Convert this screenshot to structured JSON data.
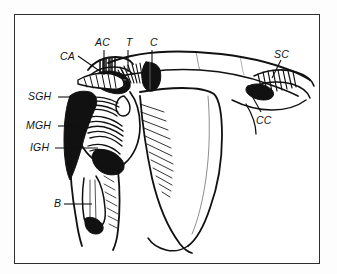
{
  "figure": {
    "type": "anatomical-line-drawing",
    "style": "black-and-white pen-and-ink hatched illustration inside a thin rectangular frame",
    "background_color": "#ffffff",
    "ink_color": "#111111",
    "frame_color": "#2e2e2e"
  },
  "labels": [
    {
      "id": "CA",
      "text": "CA",
      "meaning": "coracoacromial ligament",
      "x": 60,
      "y": 50,
      "leader": "diagonal-down-right"
    },
    {
      "id": "AC",
      "text": "AC",
      "meaning": "acromioclavicular ligament",
      "x": 95,
      "y": 36,
      "leader": "vertical-down"
    },
    {
      "id": "T",
      "text": "T",
      "meaning": "trapezoid ligament",
      "x": 126,
      "y": 36,
      "leader": "vertical-down"
    },
    {
      "id": "C",
      "text": "C",
      "meaning": "conoid ligament",
      "x": 150,
      "y": 36,
      "leader": "vertical-down"
    },
    {
      "id": "SC",
      "text": "SC",
      "meaning": "sternoclavicular ligament",
      "x": 274,
      "y": 52,
      "leader": "diagonal-down-left"
    },
    {
      "id": "CC",
      "text": "CC",
      "meaning": "costoclavicular ligament",
      "x": 256,
      "y": 114,
      "leader": "diagonal-up-right"
    },
    {
      "id": "SGH",
      "text": "SGH",
      "meaning": "superior glenohumeral ligament",
      "x": 28,
      "y": 93,
      "leader": "horizontal-right"
    },
    {
      "id": "MGH",
      "text": "MGH",
      "meaning": "middle glenohumeral ligament",
      "x": 26,
      "y": 122,
      "leader": "horizontal-right"
    },
    {
      "id": "IGH",
      "text": "IGH",
      "meaning": "inferior glenohumeral ligament",
      "x": 30,
      "y": 144,
      "leader": "horizontal-right"
    },
    {
      "id": "B",
      "text": "B",
      "meaning": "biceps tendon",
      "x": 54,
      "y": 200,
      "leader": "horizontal-right"
    }
  ],
  "structures": [
    {
      "name": "clavicle",
      "description": "long slender bone spanning the upper field from the acromioclavicular joint rightward"
    },
    {
      "name": "acromion",
      "description": "lateral bony process at the top of the scapula"
    },
    {
      "name": "coracoid-process",
      "description": "hook-shaped process with dense black shading beneath the clavicle"
    },
    {
      "name": "scapula-body",
      "description": "large triangular blade with fine diagonal hatching along its lateral border"
    },
    {
      "name": "humerus",
      "description": "shaft descending at lower left with the bicipital groove"
    },
    {
      "name": "joint-capsule",
      "description": "heavily cross-hatched glenohumeral capsule and ligament bands"
    },
    {
      "name": "sternoclavicular-region",
      "description": "hatched ligament mass at the medial end of the clavicle"
    }
  ]
}
